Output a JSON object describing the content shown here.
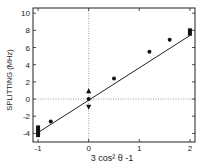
{
  "chart_data": {
    "type": "scatter",
    "title": "",
    "xlabel": "3 cos² θ -1",
    "ylabel": "SPLITTING (MHz)",
    "xlim": [
      -1.1,
      2.1
    ],
    "ylim": [
      -5,
      10.6
    ],
    "x_ticks": [
      -1,
      0,
      1,
      2
    ],
    "x_tick_labels": [
      "-1",
      "0",
      "1",
      "2"
    ],
    "y_ticks": [
      10,
      8,
      6,
      4,
      2,
      0,
      -2,
      -4
    ],
    "y_tick_labels": [
      "10",
      "8",
      "6",
      "4",
      "2",
      "0",
      "-2",
      "-4"
    ],
    "grid": false,
    "reference_lines": [
      {
        "orientation": "horizontal",
        "value": 0,
        "style": "dotted"
      },
      {
        "orientation": "vertical",
        "value": 0,
        "style": "dotted"
      }
    ],
    "series": [
      {
        "name": "squares",
        "marker": "square",
        "points": [
          {
            "x": -1,
            "y": -3.3
          },
          {
            "x": -1,
            "y": -3.6
          },
          {
            "x": -1,
            "y": -3.9
          },
          {
            "x": -1,
            "y": -4.2
          },
          {
            "x": 2,
            "y": 8.0
          },
          {
            "x": 2,
            "y": 7.6
          }
        ]
      },
      {
        "name": "circles",
        "marker": "circle",
        "points": [
          {
            "x": -0.75,
            "y": -2.6
          },
          {
            "x": 0,
            "y": 0
          },
          {
            "x": 0.5,
            "y": 2.4
          },
          {
            "x": 1.2,
            "y": 5.5
          },
          {
            "x": 1.6,
            "y": 6.9
          }
        ]
      },
      {
        "name": "triangle-up",
        "marker": "triangle-up",
        "points": [
          {
            "x": 0,
            "y": 0.9
          }
        ]
      },
      {
        "name": "triangle-down",
        "marker": "triangle-down",
        "points": [
          {
            "x": 0,
            "y": -0.9
          }
        ]
      }
    ],
    "fit_line": {
      "x": [
        -1,
        2
      ],
      "y": [
        -3.9,
        7.4
      ]
    }
  }
}
